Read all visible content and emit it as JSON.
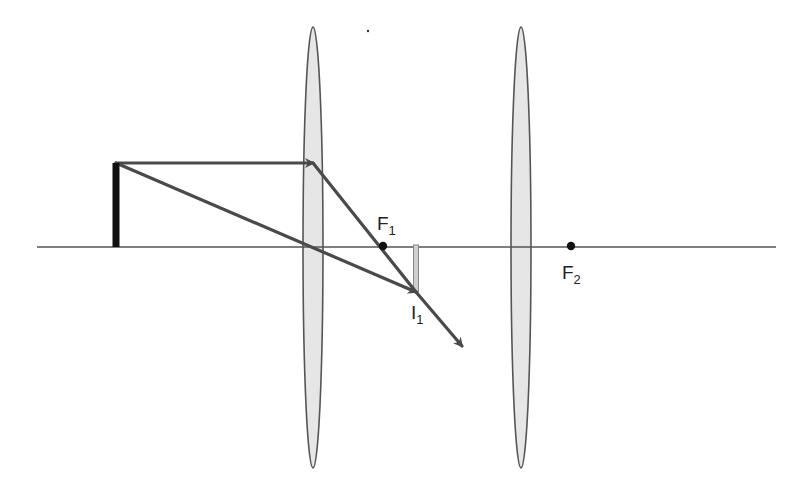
{
  "diagram": {
    "type": "two-lens ray diagram",
    "colors": {
      "background": "#ffffff",
      "axis": "#555555",
      "lens_fill": "#e6e6e6",
      "lens_stroke": "#555555",
      "object": "#111111",
      "ray": "#4a4a4a",
      "image": "#cfcfcf",
      "focal_point": "#111111",
      "label": "#222222"
    },
    "principal_axis": {
      "y": 247,
      "x_start": 37,
      "x_end": 776
    },
    "lenses": [
      {
        "name": "lens-1",
        "cx": 313,
        "top": 27,
        "bottom": 468,
        "half_width": 10
      },
      {
        "name": "lens-2",
        "cx": 521,
        "top": 27,
        "bottom": 468,
        "half_width": 10
      }
    ],
    "object": {
      "x": 116,
      "top": 163,
      "bottom": 247,
      "width": 7
    },
    "focal_points": [
      {
        "id": "F1",
        "letter": "F",
        "subscript": "1",
        "x": 383,
        "y": 246,
        "label_x": 377,
        "label_y": 214
      },
      {
        "id": "F2",
        "letter": "F",
        "subscript": "2",
        "x": 571,
        "y": 246,
        "label_x": 562,
        "label_y": 263
      }
    ],
    "image": {
      "id": "I1",
      "letter": "I",
      "subscript": "1",
      "x": 416,
      "top": 245,
      "bottom": 292,
      "width": 5,
      "label_x": 411,
      "label_y": 303
    },
    "rays": [
      {
        "name": "parallel-ray-incoming",
        "points": [
          [
            116,
            163
          ],
          [
            313,
            163
          ]
        ],
        "arrow": true
      },
      {
        "name": "parallel-ray-refracted",
        "points": [
          [
            313,
            163
          ],
          [
            416,
            292
          ]
        ],
        "arrow": false
      },
      {
        "name": "central-ray",
        "points": [
          [
            116,
            163
          ],
          [
            416,
            292
          ]
        ],
        "arrow": true
      },
      {
        "name": "emergent-ray",
        "points": [
          [
            416,
            292
          ],
          [
            462,
            346
          ]
        ],
        "arrow": true
      }
    ],
    "stray_mark": {
      "x": 368,
      "y": 31
    }
  }
}
